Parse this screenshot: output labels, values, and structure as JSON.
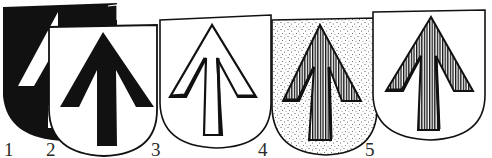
{
  "figure": {
    "colors": {
      "ink": "#111111",
      "paper": "#ffffff",
      "stipple": "#555555"
    },
    "shields": [
      {
        "number": "1",
        "field": "black",
        "charge": "white arrow",
        "label_x": 4,
        "label_y": 140
      },
      {
        "number": "2",
        "field": "white",
        "charge": "black arrow",
        "label_x": 46,
        "label_y": 140
      },
      {
        "number": "3",
        "field": "white",
        "charge": "outlined (white) arrow",
        "label_x": 151,
        "label_y": 140
      },
      {
        "number": "4",
        "field": "stippled",
        "charge": "hatched arrow",
        "label_x": 258,
        "label_y": 140
      },
      {
        "number": "5",
        "field": "white",
        "charge": "hatched arrow",
        "label_x": 365,
        "label_y": 140
      }
    ]
  }
}
